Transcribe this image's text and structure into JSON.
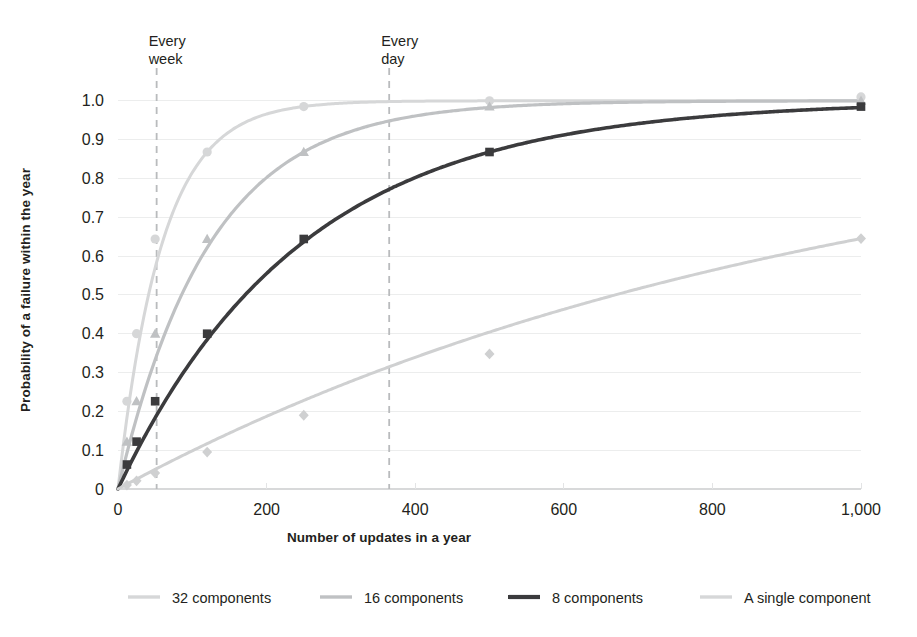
{
  "chart_data": {
    "type": "line",
    "title": "",
    "xlabel": "Number of updates in a year",
    "ylabel": "Probability of a failure within the year",
    "xlim": [
      0,
      1000
    ],
    "ylim": [
      0,
      1.02
    ],
    "grid": true,
    "legend_position": "bottom",
    "x_ticks": [
      0,
      200,
      400,
      600,
      800,
      1000
    ],
    "x_tick_labels": [
      "0",
      "200",
      "400",
      "600",
      "800",
      "1,000"
    ],
    "y_ticks": [
      0,
      0.1,
      0.2,
      0.3,
      0.4,
      0.5,
      0.6,
      0.7,
      0.8,
      0.9,
      1.0
    ],
    "y_tick_labels": [
      "0",
      "0.1",
      "0.2",
      "0.3",
      "0.4",
      "0.5",
      "0.6",
      "0.7",
      "0.8",
      "0.9",
      "1.0"
    ],
    "x": [
      0,
      12,
      25,
      50,
      120,
      250,
      500,
      1000
    ],
    "series": [
      {
        "name": "32 components",
        "marker": "circle",
        "color": "#d6d7d8",
        "linewidth": 3.0,
        "values": [
          0.0,
          0.226,
          0.4,
          0.644,
          0.868,
          0.985,
          1.0,
          1.01
        ]
      },
      {
        "name": "16 components",
        "marker": "triangle",
        "color": "#bfc1c3",
        "linewidth": 3.2,
        "values": [
          0.0,
          0.122,
          0.226,
          0.4,
          0.644,
          0.868,
          0.985,
          1.0
        ]
      },
      {
        "name": "8 components",
        "marker": "square",
        "color": "#3b3b3d",
        "linewidth": 3.6,
        "values": [
          0.0,
          0.063,
          0.122,
          0.226,
          0.4,
          0.644,
          0.868,
          0.985
        ]
      },
      {
        "name": "A single component",
        "marker": "diamond",
        "color": "#cfd0d1",
        "linewidth": 3.0,
        "values": [
          0.0,
          0.01,
          0.021,
          0.041,
          0.095,
          0.19,
          0.348,
          0.645
        ]
      }
    ],
    "annotations": [
      {
        "label_line1": "Every",
        "label_line2": "week",
        "x": 52
      },
      {
        "label_line1": "Every",
        "label_line2": "day",
        "x": 365
      }
    ]
  },
  "legend": {
    "items": [
      {
        "label": "32 components",
        "color": "#d6d7d8"
      },
      {
        "label": "16 components",
        "color": "#bfc1c3"
      },
      {
        "label": "8 components",
        "color": "#3b3b3d"
      },
      {
        "label": "A single component",
        "color": "#d6d7d8"
      }
    ]
  },
  "colors": {
    "background": "#ffffff",
    "text": "#231f20",
    "grid": "#eceded",
    "guide": "#b9bbbd"
  }
}
